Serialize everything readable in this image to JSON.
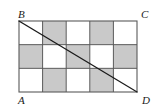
{
  "figure": {
    "colors": {
      "shaded_cell": "#c9c9c9",
      "unshaded_cell": "#ffffff",
      "grid_line": "#5a5a5a",
      "border_line": "#5a5a5a",
      "diagonal_line": "#1a1a1a",
      "label_text": "#1a1a1a",
      "background": "#ffffff"
    },
    "rectangle": {
      "x": 19,
      "y": 21,
      "width": 118,
      "height": 71,
      "columns": 5,
      "rows": 3
    },
    "grid": {
      "rows": [
        [
          "white",
          "gray",
          "white",
          "gray",
          "white"
        ],
        [
          "gray",
          "white",
          "gray",
          "white",
          "gray"
        ],
        [
          "white",
          "gray",
          "white",
          "gray",
          "white"
        ]
      ]
    },
    "diagonal": {
      "from": "B",
      "to": "D",
      "x1": 19,
      "y1": 21,
      "x2": 137,
      "y2": 92
    },
    "labels": [
      {
        "name": "vertex-label-b",
        "text": "B",
        "x": 18,
        "y": 18,
        "anchor": "start"
      },
      {
        "name": "vertex-label-c",
        "text": "C",
        "x": 141,
        "y": 18,
        "anchor": "start"
      },
      {
        "name": "vertex-label-a",
        "text": "A",
        "x": 18,
        "y": 104,
        "anchor": "start"
      },
      {
        "name": "vertex-label-d",
        "text": "D",
        "x": 142,
        "y": 104,
        "anchor": "start"
      }
    ]
  }
}
